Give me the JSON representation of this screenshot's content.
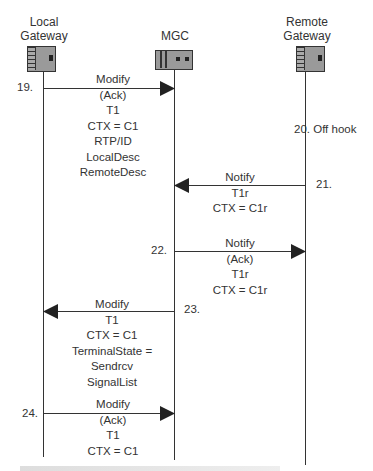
{
  "entities": [
    {
      "id": "local",
      "label": "Local\nGateway",
      "line1": "Local",
      "line2": "Gateway",
      "icon": "gateway-device-icon"
    },
    {
      "id": "mgc",
      "label": "MGC",
      "icon": "mgc-device-icon"
    },
    {
      "id": "remote",
      "label": "Remote\nGateway",
      "line1": "Remote",
      "line2": "Gateway",
      "icon": "gateway-device-icon"
    }
  ],
  "messages": [
    {
      "step": "19.",
      "from": "local",
      "to": "mgc",
      "lines": [
        "Modify",
        "(Ack)",
        "T1",
        "CTX = C1",
        "RTP/ID",
        "LocalDesc",
        "RemoteDesc"
      ]
    },
    {
      "step": "20.",
      "event": "Off hook",
      "at": "remote",
      "text": "20. Off hook"
    },
    {
      "step": "21.",
      "from": "remote",
      "to": "mgc",
      "lines": [
        "Notify",
        "T1r",
        "CTX = C1r"
      ]
    },
    {
      "step": "22.",
      "from": "mgc",
      "to": "remote",
      "lines": [
        "Notify",
        "(Ack)",
        "T1r",
        "CTX = C1r"
      ]
    },
    {
      "step": "23.",
      "from": "mgc",
      "to": "local",
      "lines": [
        "Modify",
        "T1",
        "CTX = C1",
        "TerminalState =",
        "Sendrcv",
        "SignalList"
      ]
    },
    {
      "step": "24.",
      "from": "local",
      "to": "mgc",
      "lines": [
        "Modify",
        "(Ack)",
        "T1",
        "CTX = C1"
      ]
    }
  ],
  "caption": "Figure (partially cropped)",
  "colors": {
    "line": "#333333",
    "device_fill": "#9a9a9a",
    "background": "#ffffff"
  }
}
